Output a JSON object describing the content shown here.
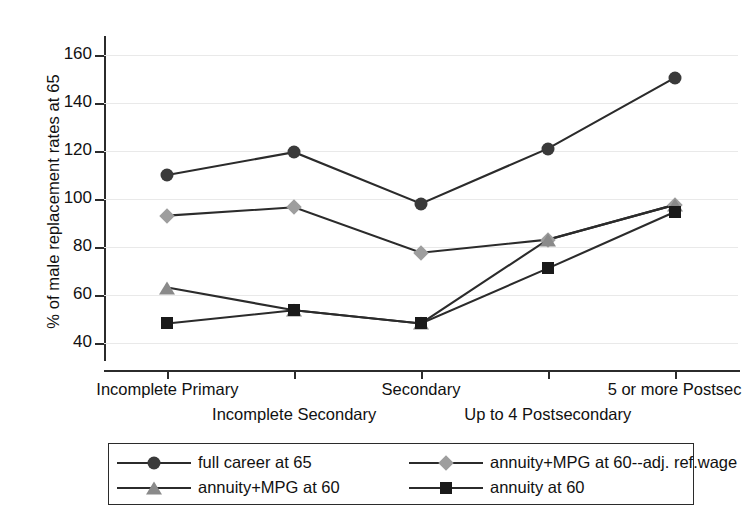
{
  "chart_data": {
    "type": "line",
    "title": "",
    "xlabel": "",
    "ylabel": "% of male replacement rates at 65",
    "ylim": [
      34,
      168
    ],
    "yticks": [
      40,
      60,
      80,
      100,
      120,
      140,
      160
    ],
    "ytick_labels": [
      "40",
      "60",
      "80",
      "100",
      "120",
      "140",
      "160"
    ],
    "grid": true,
    "legend_position": "below-plot",
    "categories": [
      "Incomplete Primary",
      "Incomplete Secondary",
      "Secondary",
      "Up to 4 Postsecondary",
      "5 or more Postsec"
    ],
    "series": [
      {
        "name": "full career at 65",
        "marker": "circle",
        "color": "#3a3a3a",
        "line_color": "#2b2b2b",
        "values": [
          110,
          119.5,
          98,
          121,
          150.5
        ]
      },
      {
        "name": "annuity+MPG at 60--adj. ref.wage",
        "marker": "diamond",
        "color": "#9e9e9e",
        "line_color": "#2b2b2b",
        "values": [
          93,
          96.5,
          77.5,
          83,
          97.5
        ]
      },
      {
        "name": "annuity+MPG at 60",
        "marker": "triangle",
        "color": "#8a8a8a",
        "line_color": "#2b2b2b",
        "values": [
          63,
          53.5,
          48,
          83,
          97.5
        ]
      },
      {
        "name": "annuity at 60",
        "marker": "square",
        "color": "#1a1a1a",
        "line_color": "#2b2b2b",
        "values": [
          48,
          53.5,
          48,
          71,
          94.5
        ]
      }
    ]
  },
  "axis": {
    "y_title": "% of male replacement rates at 65"
  },
  "legend": {
    "entries": [
      {
        "label": "full career at 65",
        "marker": "circle-marker",
        "color": "#3a3a3a"
      },
      {
        "label": "annuity+MPG at 60--adj. ref.wage",
        "marker": "diamond-marker",
        "color": "#9e9e9e"
      },
      {
        "label": "annuity+MPG at 60",
        "marker": "triangle-marker",
        "color": "#8a8a8a"
      },
      {
        "label": "annuity at 60",
        "marker": "square-marker",
        "color": "#1a1a1a"
      }
    ]
  },
  "colors": {
    "axis": "#2b2b2b",
    "grid": "#e9e9e9",
    "background": "#ffffff",
    "text": "#111111"
  }
}
